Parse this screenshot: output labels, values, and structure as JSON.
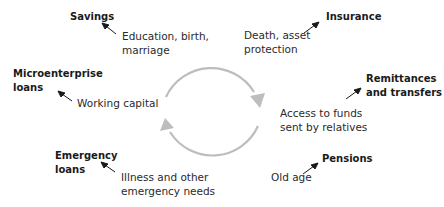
{
  "diagram": {
    "type": "cycle",
    "cycle_color": "#bdbdbd",
    "arrow_color": "#1a1a1a",
    "products": [
      {
        "id": "savings",
        "name_lines": [
          "Savings"
        ],
        "need_lines": [
          "Education, birth,",
          "marriage"
        ]
      },
      {
        "id": "insurance",
        "name_lines": [
          "Insurance"
        ],
        "need_lines": [
          "Death, asset",
          "protection"
        ]
      },
      {
        "id": "microenterprise",
        "name_lines": [
          "Microenterprise",
          "loans"
        ],
        "need_lines": [
          "Working capital"
        ]
      },
      {
        "id": "remittances",
        "name_lines": [
          "Remittances",
          "and transfers"
        ],
        "need_lines": [
          "Access to funds",
          "sent by relatives"
        ]
      },
      {
        "id": "emergency",
        "name_lines": [
          "Emergency",
          "loans"
        ],
        "need_lines": [
          "Illness and other",
          "emergency needs"
        ]
      },
      {
        "id": "pensions",
        "name_lines": [
          "Pensions"
        ],
        "need_lines": [
          "Old age"
        ]
      }
    ]
  }
}
